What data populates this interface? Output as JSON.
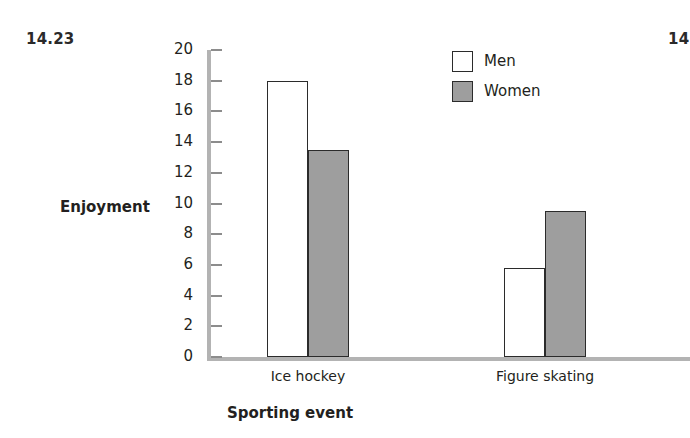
{
  "figure": {
    "number_left": "14.23",
    "number_right": "14"
  },
  "chart_data": {
    "type": "bar",
    "title": "",
    "xlabel": "Sporting event",
    "ylabel": "Enjoyment",
    "categories": [
      "Ice hockey",
      "Figure skating"
    ],
    "series": [
      {
        "name": "Men",
        "values": [
          18.0,
          5.8
        ],
        "color": "#ffffff"
      },
      {
        "name": "Women",
        "values": [
          13.5,
          9.5
        ],
        "color": "#9e9e9e"
      }
    ],
    "ylim": [
      0,
      20
    ],
    "ytick_step": 2,
    "ytick_labels": [
      "20",
      "18",
      "16",
      "14",
      "12",
      "10",
      "8",
      "6",
      "4",
      "2",
      "0"
    ],
    "grid": false,
    "legend_position": "top-right",
    "legend_entries": [
      "Men",
      "Women"
    ],
    "axis_color": "#b3b3b3",
    "bar_edge_color": "#2b2b2b"
  }
}
